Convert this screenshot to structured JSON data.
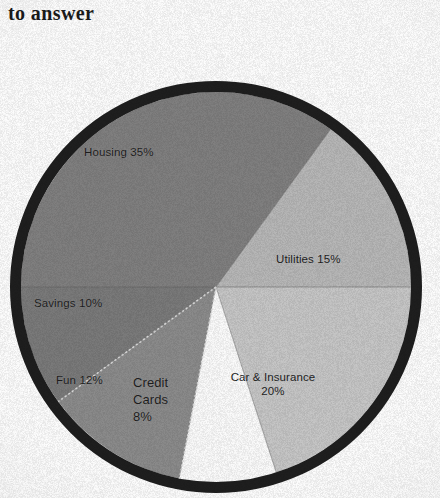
{
  "header": {
    "text": "to answer"
  },
  "colors": {
    "ring": "#1e1e1e",
    "page_background": "#fdfdfd",
    "housing": "#807f7f",
    "utilities": "#b7b7b7",
    "car": "#c6c6c6",
    "credit_cards": "#fbfbfb",
    "fun": "#8b8b8b",
    "savings": "#7a7a7a",
    "label_text": "#1d1d1d",
    "divider": "#5e5e5e",
    "divider_dotted": "#dcdcdc"
  },
  "chart_data": {
    "type": "pie",
    "title": "",
    "subtitle": "",
    "xlabel": "",
    "ylabel": "",
    "legend_position": "none",
    "grid": false,
    "units": "percent",
    "total": 100,
    "categories": [
      "Housing",
      "Utilities",
      "Car & Insurance",
      "Credit Cards",
      "Fun",
      "Savings"
    ],
    "values": [
      35,
      15,
      20,
      8,
      12,
      10
    ],
    "slices": [
      {
        "name": "Housing",
        "value": 35,
        "label": "Housing 35%",
        "color": "#807f7f",
        "start_angle": 180,
        "end_angle": 306,
        "label_x": 84,
        "label_y": 145
      },
      {
        "name": "Utilities",
        "value": 15,
        "label": "Utilities 15%",
        "color": "#b7b7b7",
        "start_angle": 306,
        "end_angle": 360,
        "label_x": 276,
        "label_y": 252
      },
      {
        "name": "Car & Insurance",
        "value": 20,
        "label": "Car & Insurance\n20%",
        "color": "#c6c6c6",
        "start_angle": 0,
        "end_angle": 72,
        "label_x": 217,
        "label_y": 370
      },
      {
        "name": "Credit Cards",
        "value": 8,
        "label": "Credit\nCards\n8%",
        "color": "#fbfbfb",
        "start_angle": 72,
        "end_angle": 100.8,
        "label_x": 133,
        "label_y": 374
      },
      {
        "name": "Fun",
        "value": 12,
        "label": "Fun 12%",
        "color": "#8b8b8b",
        "start_angle": 100.8,
        "end_angle": 144,
        "label_x": 56,
        "label_y": 373
      },
      {
        "name": "Savings",
        "value": 10,
        "label": "Savings 10%",
        "color": "#7a7a7a",
        "start_angle": 144,
        "end_angle": 180,
        "label_x": 34,
        "label_y": 296
      }
    ],
    "geometry": {
      "center_x": 216,
      "center_y": 287,
      "radius": 206,
      "ring_width": 11
    }
  }
}
